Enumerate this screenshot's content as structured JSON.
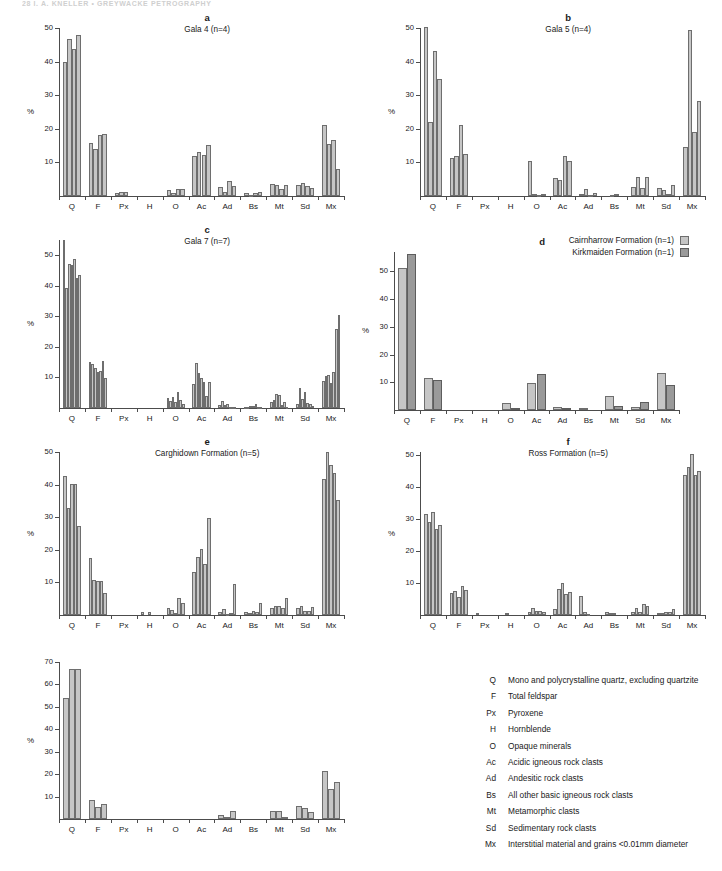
{
  "running_head": "28   I. A. KNELLER   •   GREYWACKE PETROGRAPHY",
  "axis": {
    "ylabel": "%",
    "categories": [
      "Q",
      "F",
      "Px",
      "H",
      "O",
      "Ac",
      "Ad",
      "Bs",
      "Mt",
      "Sd",
      "Mx"
    ]
  },
  "legend_d": {
    "items": [
      {
        "label": "Cairnharrow Formation (n=1)",
        "swatch": "light"
      },
      {
        "label": "Kirkmaiden Formation (n=1)",
        "swatch": "dark"
      }
    ]
  },
  "key": {
    "rows": [
      {
        "abbr": "Q",
        "desc": "Mono and polycrystalline quartz, excluding quartzite"
      },
      {
        "abbr": "F",
        "desc": "Total feldspar"
      },
      {
        "abbr": "Px",
        "desc": "Pyroxene"
      },
      {
        "abbr": "H",
        "desc": "Hornblende"
      },
      {
        "abbr": "O",
        "desc": "Opaque minerals"
      },
      {
        "abbr": "Ac",
        "desc": "Acidic igneous rock clasts"
      },
      {
        "abbr": "Ad",
        "desc": "Andesitic rock clasts"
      },
      {
        "abbr": "Bs",
        "desc": "All other basic igneous rock clasts"
      },
      {
        "abbr": "Mt",
        "desc": "Metamorphic clasts"
      },
      {
        "abbr": "Sd",
        "desc": "Sedimentary rock clasts"
      },
      {
        "abbr": "Mx",
        "desc": "Interstitial material and grains <0.01mm diameter"
      }
    ]
  },
  "colors": {
    "bar_light": "#c6c6c6",
    "bar_dark": "#9a9a9a",
    "bar_outline": "#6e6e6e",
    "axis": "#4c4c4c",
    "text": "#1a1a1a"
  },
  "chart_data": [
    {
      "id": "a",
      "type": "bar",
      "letter": "a",
      "title": "Gala 4 (n=4)",
      "ylabel": "%",
      "ylim": [
        0,
        50
      ],
      "yticks": [
        10,
        20,
        30,
        40,
        50
      ],
      "categories": [
        "Q",
        "F",
        "Px",
        "H",
        "O",
        "Ac",
        "Ad",
        "Bs",
        "Mt",
        "Sd",
        "Mx"
      ],
      "n_series": 4,
      "values": {
        "Q": [
          40.0,
          46.8,
          43.8,
          47.8
        ],
        "F": [
          15.7,
          13.9,
          18.3,
          18.6
        ],
        "Px": [
          1.0,
          1.1,
          1.1,
          0.0
        ],
        "H": [
          0.0,
          0.0,
          0.0,
          0.0
        ],
        "O": [
          1.8,
          1.0,
          2.0,
          2.2
        ],
        "Ac": [
          12.0,
          13.0,
          12.1,
          15.2
        ],
        "Ad": [
          2.6,
          1.3,
          4.5,
          3.1
        ],
        "Bs": [
          0.8,
          0.3,
          0.9,
          1.2
        ],
        "Mt": [
          3.5,
          3.4,
          2.2,
          3.4
        ],
        "Sd": [
          3.3,
          4.0,
          2.9,
          2.3
        ],
        "Mx": [
          21.2,
          15.4,
          16.8,
          8.1
        ]
      }
    },
    {
      "id": "b",
      "type": "bar",
      "letter": "b",
      "title": "Gala 5 (n=4)",
      "ylabel": "%",
      "ylim": [
        0,
        50
      ],
      "yticks": [
        10,
        20,
        30,
        40,
        50
      ],
      "categories": [
        "Q",
        "F",
        "Px",
        "H",
        "O",
        "Ac",
        "Ad",
        "Bs",
        "Mt",
        "Sd",
        "Mx"
      ],
      "n_series": 4,
      "values": {
        "Q": [
          50.2,
          22.1,
          43.3,
          34.9
        ],
        "F": [
          11.3,
          11.9,
          21.2,
          12.4
        ],
        "Px": [
          0.0,
          0.0,
          0.0,
          0.0
        ],
        "H": [
          0.0,
          0.0,
          0.0,
          0.0
        ],
        "O": [
          10.4,
          0.6,
          0.3,
          0.7
        ],
        "Ac": [
          5.4,
          4.9,
          11.9,
          10.4
        ],
        "Ad": [
          0.7,
          2.0,
          0.4,
          0.9
        ],
        "Bs": [
          0.0,
          0.4,
          0.5,
          0.0
        ],
        "Mt": [
          2.7,
          5.7,
          2.3,
          5.8
        ],
        "Sd": [
          2.5,
          1.9,
          0.6,
          3.2
        ],
        "Mx": [
          14.7,
          49.4,
          19.0,
          28.3
        ]
      }
    },
    {
      "id": "c",
      "type": "bar",
      "letter": "c",
      "title": "Gala 7 (n=7)",
      "ylabel": "%",
      "ylim": [
        0,
        55
      ],
      "yticks": [
        10,
        20,
        30,
        40,
        50
      ],
      "categories": [
        "Q",
        "F",
        "Px",
        "H",
        "O",
        "Ac",
        "Ad",
        "Bs",
        "Mt",
        "Sd",
        "Mx"
      ],
      "n_series": 7,
      "values": {
        "Q": [
          54.9,
          39.2,
          47.2,
          46.7,
          48.8,
          42.5,
          43.4
        ],
        "F": [
          15.0,
          14.5,
          13.2,
          11.7,
          12.1,
          15.5,
          9.9
        ],
        "Px": [
          0.0,
          0.0,
          0.0,
          0.0,
          0.0,
          0.0,
          0.0
        ],
        "H": [
          0.0,
          0.0,
          0.0,
          0.0,
          0.0,
          0.0,
          0.0
        ],
        "O": [
          3.3,
          2.2,
          3.5,
          2.1,
          5.3,
          2.6,
          1.2
        ],
        "Ac": [
          7.9,
          14.6,
          11.5,
          9.8,
          8.5,
          3.9,
          8.6
        ],
        "Ad": [
          0.9,
          2.4,
          1.1,
          1.3,
          0.4,
          0.3,
          0.4
        ],
        "Bs": [
          0.3,
          0.4,
          0.7,
          0.6,
          1.2,
          0.4,
          0.3
        ],
        "Mt": [
          1.9,
          2.7,
          4.6,
          4.3,
          1.1,
          1.9,
          0.4
        ],
        "Sd": [
          1.2,
          6.7,
          3.0,
          5.1,
          1.7,
          1.4,
          0.6
        ],
        "Mx": [
          9.0,
          10.4,
          10.9,
          8.3,
          11.9,
          26.0,
          30.5
        ]
      }
    },
    {
      "id": "d",
      "type": "bar",
      "letter": "d",
      "title": "",
      "ylabel": "%",
      "ylim": [
        0,
        57
      ],
      "yticks": [
        10,
        20,
        30,
        40,
        50
      ],
      "categories": [
        "Q",
        "F",
        "Px",
        "H",
        "O",
        "Ac",
        "Ad",
        "Bs",
        "Mt",
        "Sd",
        "Mx"
      ],
      "n_series": 2,
      "series_names": [
        "Cairnharrow Formation (n=1)",
        "Kirkmaiden Formation (n=1)"
      ],
      "values": {
        "Q": [
          51.3,
          56.1
        ],
        "F": [
          11.4,
          11.0
        ],
        "Px": [
          0.0,
          0.0
        ],
        "H": [
          0.0,
          0.0
        ],
        "O": [
          2.6,
          0.9
        ],
        "Ac": [
          9.7,
          13.1
        ],
        "Ad": [
          1.0,
          0.6
        ],
        "Bs": [
          0.7,
          0.0
        ],
        "Mt": [
          5.1,
          1.6
        ],
        "Sd": [
          1.1,
          2.8
        ],
        "Mx": [
          13.5,
          9.0
        ]
      }
    },
    {
      "id": "e",
      "type": "bar",
      "letter": "e",
      "title": "Carghidown Formation (n=5)",
      "ylabel": "%",
      "ylim": [
        0,
        50
      ],
      "yticks": [
        10,
        20,
        30,
        40,
        50
      ],
      "categories": [
        "Q",
        "F",
        "Px",
        "H",
        "O",
        "Ac",
        "Ad",
        "Bs",
        "Mt",
        "Sd",
        "Mx"
      ],
      "n_series": 5,
      "values": {
        "Q": [
          42.7,
          32.9,
          40.1,
          40.2,
          27.2
        ],
        "F": [
          17.4,
          10.6,
          10.3,
          10.5,
          6.9
        ],
        "Px": [
          0.0,
          0.0,
          0.0,
          0.0,
          0.0
        ],
        "H": [
          0.8,
          0.0,
          0.9,
          0.0,
          0.0
        ],
        "O": [
          2.3,
          1.4,
          0.6,
          5.3,
          3.6
        ],
        "Ac": [
          13.1,
          17.9,
          20.1,
          15.7,
          29.8
        ],
        "Ad": [
          0.9,
          1.9,
          0.4,
          0.6,
          9.4
        ],
        "Bs": [
          0.8,
          0.5,
          1.2,
          0.8,
          3.8
        ],
        "Mt": [
          2.0,
          2.9,
          2.9,
          2.1,
          5.3
        ],
        "Sd": [
          2.2,
          2.7,
          1.3,
          1.1,
          2.4
        ],
        "Mx": [
          41.7,
          49.9,
          46.0,
          43.6,
          35.2
        ]
      }
    },
    {
      "id": "f",
      "type": "bar",
      "letter": "f",
      "title": "Ross Formation (n=5)",
      "ylabel": "%",
      "ylim": [
        0,
        51
      ],
      "yticks": [
        10,
        20,
        30,
        40,
        50
      ],
      "categories": [
        "Q",
        "F",
        "Px",
        "H",
        "O",
        "Ac",
        "Ad",
        "Bs",
        "Mt",
        "Sd",
        "Mx"
      ],
      "n_series": 5,
      "values": {
        "Q": [
          31.5,
          29.2,
          32.3,
          26.8,
          28.2
        ],
        "F": [
          7.0,
          7.4,
          5.6,
          9.2,
          7.9
        ],
        "Px": [
          0.6,
          0.0,
          0.0,
          0.0,
          0.0
        ],
        "H": [
          0.0,
          0.5,
          0.0,
          0.0,
          0.0
        ],
        "O": [
          0.8,
          2.3,
          1.2,
          1.3,
          0.8
        ],
        "Ac": [
          1.9,
          8.0,
          9.9,
          6.6,
          7.1
        ],
        "Ad": [
          6.0,
          1.0,
          0.3,
          0.0,
          0.0
        ],
        "Bs": [
          1.0,
          0.5,
          0.5,
          0.0,
          0.0
        ],
        "Mt": [
          0.8,
          2.1,
          0.9,
          3.5,
          2.8
        ],
        "Sd": [
          0.6,
          0.6,
          0.8,
          1.0,
          1.8
        ],
        "Mx": [
          43.8,
          46.4,
          50.5,
          43.7,
          45.0
        ]
      }
    },
    {
      "id": "g",
      "type": "bar",
      "letter": "",
      "title": "",
      "ylabel": "%",
      "ylim": [
        0,
        70
      ],
      "yticks": [
        10,
        20,
        30,
        40,
        50,
        60,
        70
      ],
      "categories": [
        "Q",
        "F",
        "Px",
        "H",
        "O",
        "Ac",
        "Ad",
        "Bs",
        "Mt",
        "Sd",
        "Mx"
      ],
      "n_series": 3,
      "values": {
        "Q": [
          53.8,
          66.8,
          66.9
        ],
        "F": [
          8.5,
          5.5,
          6.7
        ],
        "Px": [
          0.0,
          0.0,
          0.0
        ],
        "H": [
          0.0,
          0.0,
          0.0
        ],
        "O": [
          0.0,
          0.0,
          0.0
        ],
        "Ac": [
          0.0,
          0.0,
          0.0
        ],
        "Ad": [
          1.6,
          1.0,
          3.5
        ],
        "Bs": [
          0.0,
          0.0,
          0.0
        ],
        "Mt": [
          3.6,
          3.5,
          0.9
        ],
        "Sd": [
          5.9,
          4.7,
          3.0
        ],
        "Mx": [
          21.2,
          13.2,
          16.4
        ]
      }
    }
  ]
}
